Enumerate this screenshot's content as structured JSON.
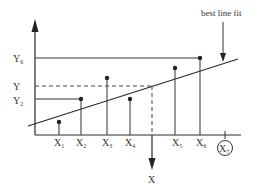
{
  "diagram": {
    "annotation": "best line fit",
    "x_axis_label": "X",
    "y_axis_label": "Y",
    "y_labels": [
      {
        "id": "y6",
        "base": "Y",
        "sub": "6"
      },
      {
        "id": "y",
        "base": "Y",
        "sub": ""
      },
      {
        "id": "y2",
        "base": "Y",
        "sub": "2"
      }
    ],
    "points": [
      {
        "base": "X",
        "sub": "1"
      },
      {
        "base": "X",
        "sub": "2"
      },
      {
        "base": "X",
        "sub": "3"
      },
      {
        "base": "X",
        "sub": "4"
      },
      {
        "base": "X",
        "sub": "5"
      },
      {
        "base": "X",
        "sub": "6"
      }
    ],
    "circled_point": {
      "base": "X",
      "sub": "7"
    }
  }
}
